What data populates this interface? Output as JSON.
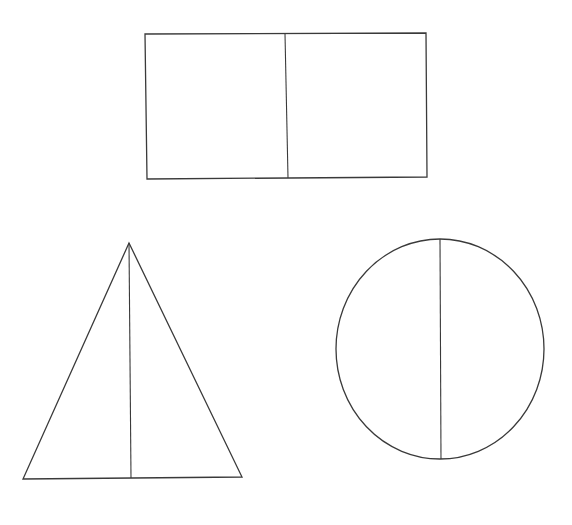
{
  "diagram": {
    "background": "#ffffff",
    "stroke_color": "#3a3a3a",
    "shapes": [
      {
        "name": "rectangle",
        "kind": "polygon",
        "points": [
          [
            145,
            34
          ],
          [
            426,
            33
          ],
          [
            427,
            177
          ],
          [
            147,
            179
          ]
        ],
        "divider": {
          "x1": 285,
          "y1": 34,
          "x2": 288,
          "y2": 178
        }
      },
      {
        "name": "triangle",
        "kind": "polygon",
        "points": [
          [
            129,
            243
          ],
          [
            242,
            477
          ],
          [
            23,
            479
          ]
        ],
        "divider": {
          "x1": 129,
          "y1": 243,
          "x2": 131,
          "y2": 478
        }
      },
      {
        "name": "circle",
        "kind": "ellipse",
        "cx": 440,
        "cy": 349,
        "rx": 104,
        "ry": 110,
        "divider": {
          "x1": 440,
          "y1": 239,
          "x2": 441,
          "y2": 459
        }
      }
    ]
  }
}
